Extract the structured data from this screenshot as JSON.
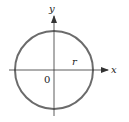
{
  "diagram": {
    "type": "circle-on-axes",
    "labels": {
      "x_axis": "x",
      "y_axis": "y",
      "radius": "r",
      "origin": "0"
    },
    "colors": {
      "circle": "#6b6b6b",
      "axes": "#333333",
      "text": "#222222",
      "background": "#ffffff"
    },
    "geometry": {
      "center": [
        54,
        70
      ],
      "radius_px": 39
    }
  }
}
